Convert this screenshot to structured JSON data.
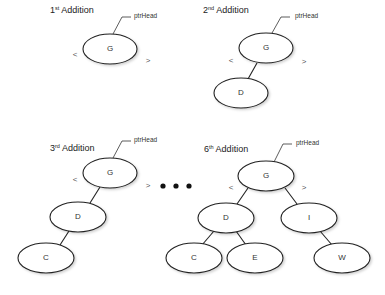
{
  "panels": [
    {
      "title_num": "1",
      "title_sup": "st",
      "title_text": " Addition",
      "pointer_label": "ptrHead",
      "less": "<",
      "greater": ">",
      "nodes": [
        "G"
      ]
    },
    {
      "title_num": "2",
      "title_sup": "nd",
      "title_text": " Addition",
      "pointer_label": "ptrHead",
      "less": "<",
      "greater": ">",
      "nodes": [
        "G",
        "D"
      ]
    },
    {
      "title_num": "3",
      "title_sup": "rd",
      "title_text": " Addition",
      "pointer_label": "ptrHead",
      "less": "<",
      "greater": ">",
      "nodes": [
        "G",
        "D",
        "C"
      ]
    },
    {
      "title_num": "6",
      "title_sup": "th",
      "title_text": " Addition",
      "pointer_label": "ptrHead",
      "less": "<",
      "greater": ">",
      "nodes": [
        "G",
        "D",
        "I",
        "C",
        "E",
        "W"
      ]
    }
  ],
  "ellipsis_icon": "three-dots"
}
